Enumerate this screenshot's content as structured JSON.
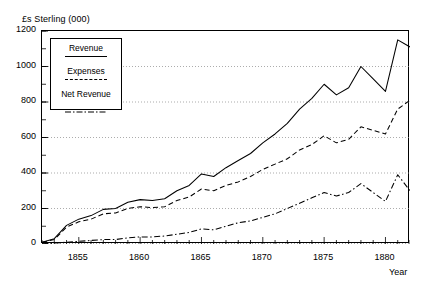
{
  "figure": {
    "ylabel": "£s Sterling (000)",
    "xlabel": "Year"
  },
  "legend": {
    "items": [
      {
        "label": "Revenue",
        "style": "solid"
      },
      {
        "label": "Expenses",
        "style": "dashed"
      },
      {
        "label": "Net Revenue",
        "style": "dashdot"
      }
    ]
  },
  "chart_data": {
    "type": "line",
    "title": "",
    "subtitle": "",
    "xlabel": "Year",
    "ylabel": "£s Sterling (000)",
    "xlim": [
      1852,
      1882
    ],
    "ylim": [
      0,
      1200
    ],
    "yticks": [
      0,
      200,
      400,
      600,
      800,
      1000,
      1200
    ],
    "ytick_labels": [
      "0",
      "200",
      "400",
      "600",
      "800",
      "1000",
      "1200"
    ],
    "xticks": [
      1855,
      1860,
      1865,
      1870,
      1875,
      1880
    ],
    "xtick_labels": [
      "1855",
      "1860",
      "1865",
      "1870",
      "1875",
      "1880"
    ],
    "minor_yticks_interval": 100,
    "minor_xticks_interval": 1,
    "grid": "horizontal-dotted",
    "legend_position": "upper-left-inside",
    "x": [
      1852,
      1853,
      1854,
      1855,
      1856,
      1857,
      1858,
      1859,
      1860,
      1861,
      1862,
      1863,
      1864,
      1865,
      1866,
      1867,
      1868,
      1869,
      1870,
      1871,
      1872,
      1873,
      1874,
      1875,
      1876,
      1877,
      1878,
      1879,
      1880,
      1881,
      1882
    ],
    "series": [
      {
        "name": "Revenue",
        "style": "solid",
        "values": [
          10,
          30,
          105,
          140,
          160,
          195,
          200,
          235,
          250,
          245,
          255,
          300,
          330,
          395,
          380,
          430,
          470,
          510,
          570,
          620,
          680,
          760,
          820,
          900,
          840,
          880,
          1000,
          930,
          860,
          1150,
          1110
        ]
      },
      {
        "name": "Expenses",
        "style": "dashed",
        "values": [
          10,
          25,
          95,
          125,
          140,
          170,
          175,
          200,
          210,
          205,
          210,
          245,
          265,
          310,
          300,
          330,
          350,
          380,
          420,
          450,
          480,
          530,
          560,
          610,
          570,
          590,
          660,
          640,
          620,
          760,
          810
        ]
      },
      {
        "name": "Net Revenue",
        "style": "dashdot",
        "values": [
          0,
          5,
          10,
          15,
          20,
          25,
          25,
          35,
          40,
          40,
          45,
          55,
          65,
          85,
          80,
          100,
          120,
          130,
          150,
          170,
          200,
          230,
          260,
          290,
          270,
          290,
          340,
          290,
          240,
          390,
          300
        ]
      }
    ]
  }
}
